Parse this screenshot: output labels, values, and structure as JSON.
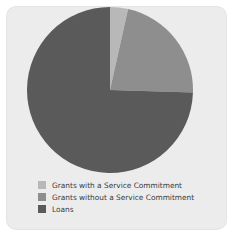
{
  "figure": {
    "background_color": "#ffffff",
    "card_color": "#ececec"
  },
  "chart_data": {
    "type": "pie",
    "title": "",
    "subtitle": "",
    "xlabel": "",
    "ylabel": "",
    "grid": false,
    "legend_position": "bottom-left",
    "start_angle_deg": 0,
    "direction": "clockwise",
    "center": {
      "x": 84,
      "y": 84
    },
    "radius": 83,
    "categories": [
      "Grants with a Service Commitment",
      "Grants without a Service Commitment",
      "Loans"
    ],
    "values": [
      3.5,
      22.0,
      74.5
    ],
    "value_unit": "percent",
    "colors": [
      "#b8b8b8",
      "#8e8e8e",
      "#5a5a5a"
    ],
    "slices": [
      {
        "label": "Grants with a Service Commitment",
        "value": 3.5,
        "color": "#b8b8b8",
        "start_angle_deg": 0,
        "end_angle_deg": 12.6
      },
      {
        "label": "Grants without a Service Commitment",
        "value": 22.0,
        "color": "#8e8e8e",
        "start_angle_deg": 12.6,
        "end_angle_deg": 91.8
      },
      {
        "label": "Loans",
        "value": 74.5,
        "color": "#5a5a5a",
        "start_angle_deg": 91.8,
        "end_angle_deg": 360
      }
    ]
  },
  "legend": {
    "items": [
      {
        "label": "Grants with a Service Commitment",
        "color": "#b8b8b8"
      },
      {
        "label": "Grants without a Service Commitment",
        "color": "#8e8e8e"
      },
      {
        "label": "Loans",
        "color": "#5a5a5a"
      }
    ]
  }
}
